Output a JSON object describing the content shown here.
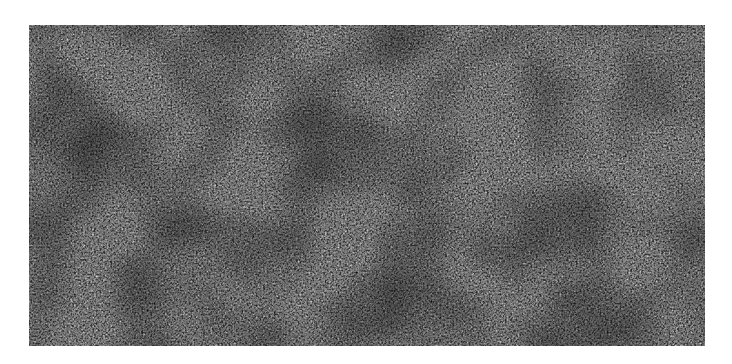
{
  "image": {
    "description": "Grayscale noise texture of dense white fibrous strands on a black background",
    "colors": {
      "background": "#ffffff",
      "dark": "#111111",
      "light": "#e8e8e8"
    }
  }
}
